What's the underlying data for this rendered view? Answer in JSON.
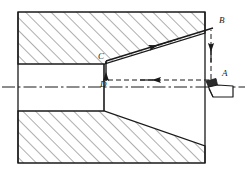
{
  "figure": {
    "type": "engineering-drawing",
    "background_color": "#ffffff",
    "line_color": "#1a1a1a",
    "hatch_color": "#555555",
    "canvas": {
      "width": 247,
      "height": 176
    }
  },
  "labels": {
    "point_a": "A",
    "point_b": "B",
    "point_c": "C",
    "point_d": "D"
  },
  "label_positions": {
    "point_a": {
      "x": 222,
      "y": 74
    },
    "point_b": {
      "x": 219,
      "y": 20
    },
    "point_c": {
      "x": 98,
      "y": 57
    },
    "point_d": {
      "x": 100,
      "y": 84
    }
  },
  "geometry": {
    "body_outline": {
      "left": 18,
      "top": 12,
      "right": 205,
      "bottom": 163
    },
    "bore_top_y": 64,
    "bore_bottom_y": 111,
    "bore_left_x": 18,
    "taper_start_x": 104,
    "centerline_y": 87,
    "centerline_left_x": 2,
    "centerline_right_x": 245,
    "taper_top_end": {
      "x": 205,
      "y": 33
    },
    "taper_bottom_end": {
      "x": 205,
      "y": 146
    }
  },
  "tool_path": {
    "segments": [
      {
        "name": "b-to-c",
        "from": "B",
        "to": "C",
        "style": "solid",
        "arrow": "midpoint-toward-C"
      },
      {
        "name": "c-to-d",
        "from": "C",
        "to": "D",
        "style": "solid",
        "arrow": "toward-D"
      },
      {
        "name": "d-to-a",
        "from": "D",
        "to": "A",
        "style": "dashed",
        "arrow": "toward-A"
      },
      {
        "name": "a-to-b",
        "from": "A",
        "to": "B",
        "style": "dashed",
        "arrow": "toward-B"
      }
    ]
  },
  "tool": {
    "name": "lathe-cutting-tool",
    "tip": {
      "x": 207,
      "y": 84
    }
  }
}
